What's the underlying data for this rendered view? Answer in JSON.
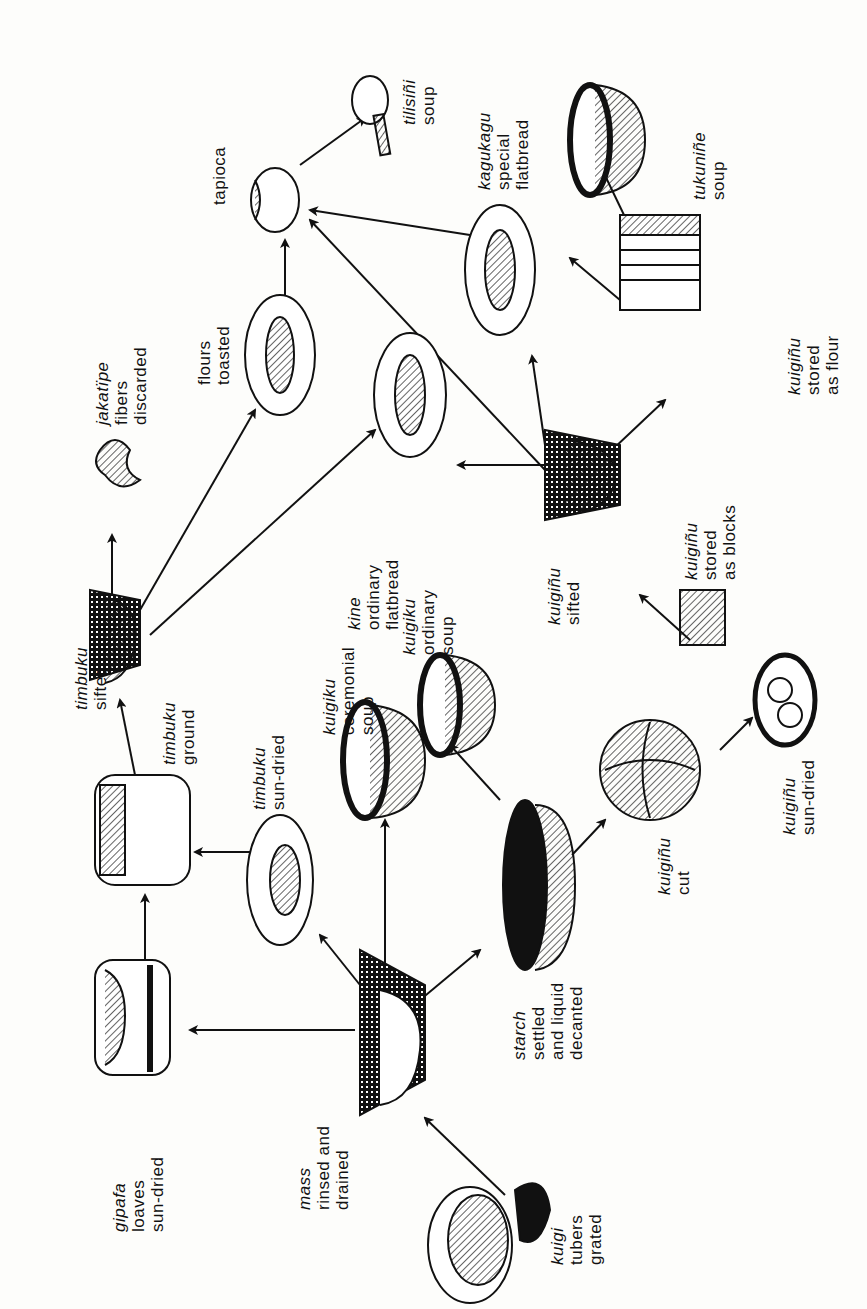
{
  "diagram": {
    "type": "process-flow",
    "orientation": "rotated-90-ccw",
    "nodes": [
      {
        "id": "kuigi",
        "term": "kuigi",
        "lines": [
          "tubers",
          "grated"
        ]
      },
      {
        "id": "mass",
        "term": "mass",
        "lines": [
          "rinsed and",
          "drained"
        ]
      },
      {
        "id": "gipafa",
        "term": "gipafa",
        "lines": [
          "loaves",
          "sun-dried"
        ]
      },
      {
        "id": "starch",
        "term": "starch",
        "lines": [
          "settled",
          "and liquid",
          "decanted"
        ]
      },
      {
        "id": "timbuku_dried",
        "term": "timbuku",
        "lines": [
          "sun-dried"
        ]
      },
      {
        "id": "timbuku_ground",
        "term": "timbuku",
        "lines": [
          "ground"
        ]
      },
      {
        "id": "timbuku_sifted",
        "term": "timbuku",
        "lines": [
          "sifted"
        ]
      },
      {
        "id": "jakatipe",
        "term": "jakatïpe",
        "lines": [
          "fibers",
          "discarded"
        ]
      },
      {
        "id": "flours",
        "term": "",
        "lines": [
          "flours",
          "toasted"
        ]
      },
      {
        "id": "tapioca",
        "term": "",
        "lines": [
          "tapioca"
        ]
      },
      {
        "id": "tilisini",
        "term": "tilisiñi",
        "lines": [
          "soup"
        ]
      },
      {
        "id": "kuigiku_cer",
        "term": "kuigiku",
        "lines": [
          "ceremonial",
          "soup"
        ]
      },
      {
        "id": "kuigiku_ord",
        "term": "kuigiku",
        "lines": [
          "ordinary",
          "soup"
        ]
      },
      {
        "id": "kine",
        "term": "kine",
        "lines": [
          "ordinary",
          "flatbread"
        ]
      },
      {
        "id": "kuigino_cut",
        "term": "kuigiñu",
        "lines": [
          "cut"
        ]
      },
      {
        "id": "kuigino_dried",
        "term": "kuigiñu",
        "lines": [
          "sun-dried"
        ]
      },
      {
        "id": "kuigino_blocks",
        "term": "kuigiñu",
        "lines": [
          "stored",
          "as blocks"
        ]
      },
      {
        "id": "kuigino_sifted",
        "term": "kuigiñu",
        "lines": [
          "sifted"
        ]
      },
      {
        "id": "kuigino_flour",
        "term": "kuigiñu",
        "lines": [
          "stored",
          "as flour"
        ]
      },
      {
        "id": "kagukagu",
        "term": "kagukagu",
        "lines": [
          "special",
          "flatbread"
        ]
      },
      {
        "id": "tukunine",
        "term": "tukuniñe",
        "lines": [
          "soup"
        ]
      }
    ],
    "edges": [
      [
        "kuigi",
        "mass"
      ],
      [
        "mass",
        "gipafa"
      ],
      [
        "mass",
        "timbuku_dried"
      ],
      [
        "mass",
        "kuigiku_cer"
      ],
      [
        "mass",
        "starch"
      ],
      [
        "gipafa",
        "timbuku_ground"
      ],
      [
        "timbuku_dried",
        "timbuku_ground"
      ],
      [
        "timbuku_ground",
        "timbuku_sifted"
      ],
      [
        "timbuku_sifted",
        "jakatipe"
      ],
      [
        "timbuku_sifted",
        "flours"
      ],
      [
        "timbuku_sifted",
        "kine"
      ],
      [
        "flours",
        "tapioca"
      ],
      [
        "tapioca",
        "tilisini"
      ],
      [
        "starch",
        "kuigiku_ord"
      ],
      [
        "starch",
        "kuigino_cut"
      ],
      [
        "kuigino_cut",
        "kuigino_dried"
      ],
      [
        "kuigino_dried",
        "kuigino_blocks"
      ],
      [
        "kuigino_blocks",
        "kuigino_sifted"
      ],
      [
        "kuigino_sifted",
        "kine"
      ],
      [
        "kuigino_sifted",
        "kagukagu"
      ],
      [
        "kuigino_sifted",
        "kuigino_flour"
      ],
      [
        "kuigino_sifted",
        "tapioca"
      ],
      [
        "kuigino_flour",
        "kagukagu"
      ],
      [
        "kuigino_flour",
        "tukunine"
      ],
      [
        "kagukagu",
        "tapioca"
      ]
    ]
  }
}
